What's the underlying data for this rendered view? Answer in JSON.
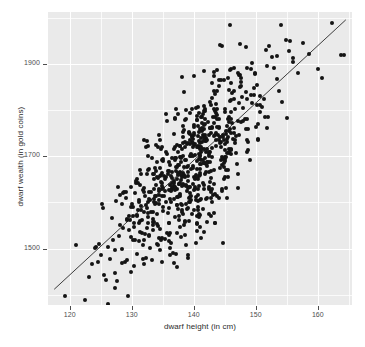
{
  "chart_data": {
    "type": "scatter",
    "title": "",
    "xlabel": "dwarf height (in cm)",
    "ylabel": "dwarf wealth (in gold coins)",
    "xlim": [
      116.5,
      165.5
    ],
    "ylim": [
      1378,
      2012
    ],
    "xticks": [
      120,
      130,
      140,
      150,
      160
    ],
    "yticks": [
      1500,
      1700,
      1900
    ],
    "xtick_labels": [
      "120",
      "130",
      "140",
      "150",
      "160"
    ],
    "ytick_labels": [
      "1500",
      "1700",
      "1900"
    ],
    "grid": true,
    "grid_color": "#ffffff",
    "panel_background": "#eaeaea",
    "point_color": "#141414",
    "point_size": 4,
    "legend": "none",
    "trend_line": {
      "type": "linear",
      "color": "#3d3d3d",
      "x_start": 117.5,
      "y_start": 1412,
      "x_end": 164.5,
      "y_end": 1995
    },
    "n_points": 700,
    "series": [
      {
        "name": "dwarfs",
        "points": [
          [
            119.2,
            1398
          ],
          [
            121.0,
            1508
          ],
          [
            122.4,
            1388
          ],
          [
            123.1,
            1438
          ],
          [
            123.6,
            1466
          ],
          [
            124.0,
            1502
          ],
          [
            124.3,
            1504
          ],
          [
            124.5,
            1470
          ],
          [
            124.8,
            1510
          ],
          [
            125.0,
            1486
          ],
          [
            125.2,
            1596
          ],
          [
            125.4,
            1588
          ],
          [
            125.6,
            1442
          ],
          [
            125.9,
            1432
          ],
          [
            126.2,
            1504
          ],
          [
            126.5,
            1478
          ],
          [
            126.8,
            1566
          ],
          [
            127.0,
            1518
          ],
          [
            127.3,
            1448
          ],
          [
            127.6,
            1430
          ],
          [
            127.9,
            1528
          ],
          [
            128.1,
            1552
          ],
          [
            128.4,
            1500
          ],
          [
            128.6,
            1544
          ],
          [
            128.9,
            1472
          ],
          [
            129.1,
            1610
          ],
          [
            129.3,
            1564
          ],
          [
            129.5,
            1540
          ],
          [
            129.8,
            1526
          ],
          [
            130.0,
            1596
          ],
          [
            130.2,
            1570
          ],
          [
            130.4,
            1556
          ],
          [
            130.6,
            1518
          ],
          [
            130.8,
            1488
          ],
          [
            131.0,
            1642
          ],
          [
            131.2,
            1600
          ],
          [
            131.4,
            1560
          ],
          [
            131.6,
            1534
          ],
          [
            131.8,
            1508
          ],
          [
            132.0,
            1466
          ],
          [
            132.2,
            1614
          ],
          [
            132.4,
            1588
          ],
          [
            132.6,
            1556
          ],
          [
            132.8,
            1530
          ],
          [
            133.0,
            1502
          ],
          [
            133.2,
            1476
          ],
          [
            133.4,
            1662
          ],
          [
            133.6,
            1630
          ],
          [
            133.8,
            1596
          ],
          [
            134.0,
            1574
          ],
          [
            134.2,
            1548
          ],
          [
            134.4,
            1522
          ],
          [
            134.6,
            1498
          ],
          [
            134.8,
            1470
          ],
          [
            135.0,
            1690
          ],
          [
            135.2,
            1658
          ],
          [
            135.4,
            1624
          ],
          [
            135.6,
            1600
          ],
          [
            135.8,
            1578
          ],
          [
            136.0,
            1556
          ],
          [
            136.2,
            1534
          ],
          [
            136.4,
            1512
          ],
          [
            136.6,
            1490
          ],
          [
            136.8,
            1468
          ],
          [
            137.0,
            1720
          ],
          [
            137.2,
            1696
          ],
          [
            137.4,
            1664
          ],
          [
            137.6,
            1640
          ],
          [
            137.8,
            1618
          ],
          [
            138.0,
            1596
          ],
          [
            138.2,
            1574
          ],
          [
            138.4,
            1552
          ],
          [
            138.6,
            1530
          ],
          [
            138.8,
            1508
          ],
          [
            139.0,
            1486
          ],
          [
            139.2,
            1752
          ],
          [
            139.4,
            1726
          ],
          [
            139.6,
            1700
          ],
          [
            139.8,
            1678
          ],
          [
            140.0,
            1656
          ],
          [
            140.2,
            1634
          ],
          [
            140.4,
            1612
          ],
          [
            140.6,
            1590
          ],
          [
            140.8,
            1568
          ],
          [
            141.0,
            1546
          ],
          [
            141.2,
            1524
          ],
          [
            141.4,
            1784
          ],
          [
            141.6,
            1758
          ],
          [
            141.8,
            1732
          ],
          [
            142.0,
            1710
          ],
          [
            142.2,
            1688
          ],
          [
            142.4,
            1666
          ],
          [
            142.6,
            1644
          ],
          [
            142.8,
            1622
          ],
          [
            143.0,
            1600
          ],
          [
            143.2,
            1578
          ],
          [
            143.4,
            1556
          ],
          [
            143.6,
            1812
          ],
          [
            143.8,
            1790
          ],
          [
            144.0,
            1764
          ],
          [
            144.2,
            1742
          ],
          [
            144.4,
            1720
          ],
          [
            144.6,
            1698
          ],
          [
            144.8,
            1676
          ],
          [
            145.0,
            1654
          ],
          [
            145.2,
            1632
          ],
          [
            145.4,
            1610
          ],
          [
            145.6,
            1844
          ],
          [
            145.8,
            1820
          ],
          [
            146.0,
            1796
          ],
          [
            146.2,
            1772
          ],
          [
            146.4,
            1750
          ],
          [
            146.6,
            1728
          ],
          [
            146.8,
            1706
          ],
          [
            147.0,
            1684
          ],
          [
            147.2,
            1662
          ],
          [
            147.4,
            1876
          ],
          [
            147.6,
            1852
          ],
          [
            147.8,
            1828
          ],
          [
            148.0,
            1804
          ],
          [
            148.2,
            1780
          ],
          [
            148.4,
            1758
          ],
          [
            148.6,
            1736
          ],
          [
            148.8,
            1714
          ],
          [
            149.0,
            1692
          ],
          [
            149.4,
            1902
          ],
          [
            149.8,
            1878
          ],
          [
            150.2,
            1854
          ],
          [
            150.6,
            1830
          ],
          [
            151.0,
            1806
          ],
          [
            151.4,
            1784
          ],
          [
            151.8,
            1762
          ],
          [
            152.2,
            1938
          ],
          [
            152.6,
            1914
          ],
          [
            153.0,
            1890
          ],
          [
            153.4,
            1866
          ],
          [
            153.8,
            1842
          ],
          [
            154.2,
            1818
          ],
          [
            154.8,
            1952
          ],
          [
            155.4,
            1928
          ],
          [
            156.0,
            1904
          ],
          [
            156.8,
            1880
          ],
          [
            157.6,
            1946
          ],
          [
            158.6,
            1922
          ],
          [
            160.0,
            1888
          ],
          [
            162.2,
            1988
          ],
          [
            163.8,
            1920
          ],
          [
            164.2,
            1918
          ]
        ]
      }
    ]
  },
  "axes": {
    "x_title": "dwarf height (in cm)",
    "y_title": "dwarf wealth (in gold coins)",
    "x_ticks": [
      "120",
      "130",
      "140",
      "150",
      "160"
    ],
    "y_ticks": [
      "1900",
      "1700",
      "1500"
    ]
  }
}
